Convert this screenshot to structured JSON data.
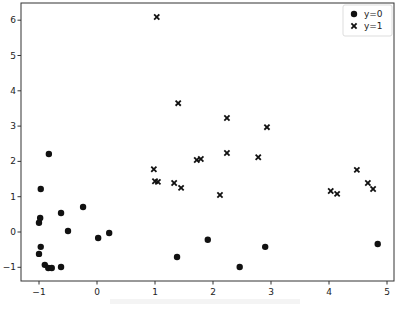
{
  "chart_data": {
    "type": "scatter",
    "title": "",
    "xlabel": "",
    "ylabel": "",
    "xlim": [
      -1.3,
      5.15
    ],
    "ylim": [
      -1.38,
      6.4
    ],
    "xticks": [
      -1,
      0,
      1,
      2,
      3,
      4,
      5
    ],
    "yticks": [
      -1,
      0,
      1,
      2,
      3,
      4,
      5,
      6
    ],
    "grid": false,
    "legend_position": "upper right",
    "series": [
      {
        "name": "y=0",
        "marker": "circle",
        "color": "#111111",
        "points": [
          [
            -0.83,
            2.21
          ],
          [
            -0.97,
            1.22
          ],
          [
            -0.62,
            0.54
          ],
          [
            -0.24,
            0.71
          ],
          [
            -0.98,
            0.4
          ],
          [
            -1.0,
            0.26
          ],
          [
            -0.5,
            0.03
          ],
          [
            0.02,
            -0.17
          ],
          [
            0.21,
            -0.03
          ],
          [
            -0.97,
            -0.42
          ],
          [
            -1.0,
            -0.62
          ],
          [
            -0.9,
            -0.93
          ],
          [
            -0.84,
            -1.02
          ],
          [
            -0.78,
            -1.02
          ],
          [
            -0.62,
            -0.99
          ],
          [
            1.38,
            -0.71
          ],
          [
            1.91,
            -0.22
          ],
          [
            2.46,
            -0.99
          ],
          [
            2.9,
            -0.42
          ],
          [
            4.84,
            -0.34
          ]
        ]
      },
      {
        "name": "y=1",
        "marker": "x",
        "color": "#111111",
        "points": [
          [
            1.03,
            6.09
          ],
          [
            1.4,
            3.65
          ],
          [
            2.24,
            3.23
          ],
          [
            2.93,
            2.97
          ],
          [
            0.98,
            1.78
          ],
          [
            1.0,
            1.44
          ],
          [
            1.05,
            1.42
          ],
          [
            1.33,
            1.39
          ],
          [
            1.45,
            1.25
          ],
          [
            1.72,
            2.04
          ],
          [
            1.79,
            2.07
          ],
          [
            2.24,
            2.24
          ],
          [
            2.78,
            2.12
          ],
          [
            2.12,
            1.05
          ],
          [
            4.48,
            1.76
          ],
          [
            4.67,
            1.39
          ],
          [
            4.76,
            1.22
          ],
          [
            4.03,
            1.16
          ],
          [
            4.14,
            1.08
          ]
        ]
      }
    ]
  }
}
